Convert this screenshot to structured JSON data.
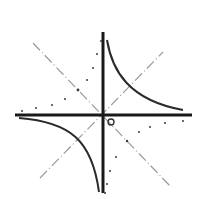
{
  "diagram": {
    "type": "function-graph",
    "colors": {
      "background": "#ffffff",
      "axes": "#1a1a1a",
      "curve": "#2a2a2a",
      "dashed": "#9a9a9a",
      "dots": "#3a3a3a"
    },
    "origin": {
      "x": 103,
      "y": 115
    },
    "origin_marker": "o",
    "elements": [
      {
        "name": "x-axis",
        "kind": "solid-thick"
      },
      {
        "name": "y-axis",
        "kind": "solid-thick"
      },
      {
        "name": "hyperbola-q1",
        "kind": "solid-curve"
      },
      {
        "name": "hyperbola-q3",
        "kind": "solid-curve"
      },
      {
        "name": "diagonal-y-eq-x",
        "kind": "dash-dot"
      },
      {
        "name": "diagonal-y-eq-neg-x",
        "kind": "dash-dot"
      },
      {
        "name": "dotted-curve-q2",
        "kind": "dotted"
      },
      {
        "name": "dotted-curve-q4",
        "kind": "dotted"
      }
    ]
  }
}
